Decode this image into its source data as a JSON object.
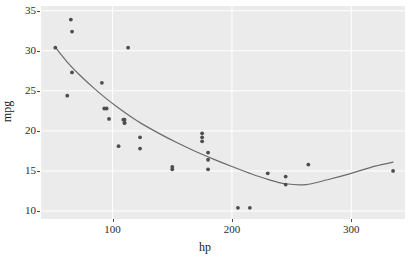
{
  "chart_data": {
    "type": "scatter",
    "title": "",
    "xlabel": "hp",
    "ylabel": "mpg",
    "xlim": [
      40,
      345
    ],
    "ylim": [
      9.0,
      35.6
    ],
    "xticks": [
      100,
      200,
      300
    ],
    "xticklabels": [
      "100",
      "200",
      "300"
    ],
    "yticks": [
      10,
      15,
      20,
      25,
      30,
      35
    ],
    "yticklabels": [
      "10",
      "15",
      "20",
      "25",
      "30",
      "35"
    ],
    "grid": true,
    "grid_major_color": "#ffffff",
    "panel_background": "#ebebeb",
    "point_color": "#4d4d4d",
    "line_color": "#6b6b6b",
    "legend": "none",
    "series": [
      {
        "name": "observations",
        "type": "scatter",
        "x": [
          110,
          110,
          93,
          110,
          175,
          105,
          245,
          62,
          95,
          123,
          123,
          180,
          180,
          180,
          205,
          215,
          230,
          66,
          52,
          65,
          97,
          150,
          150,
          245,
          175,
          66,
          91,
          113,
          264,
          175,
          335,
          109
        ],
        "y": [
          21.0,
          21.0,
          22.8,
          21.4,
          18.7,
          18.1,
          14.3,
          24.4,
          22.8,
          19.2,
          17.8,
          16.4,
          17.3,
          15.2,
          10.4,
          10.4,
          14.7,
          32.4,
          30.4,
          33.9,
          21.5,
          15.5,
          15.2,
          13.3,
          19.2,
          27.3,
          26.0,
          30.4,
          15.8,
          19.7,
          15.0,
          21.4
        ]
      },
      {
        "name": "smooth-fit",
        "type": "line",
        "x": [
          52,
          62,
          72,
          85,
          95,
          105,
          115,
          125,
          140,
          155,
          170,
          185,
          200,
          215,
          230,
          245,
          262,
          280,
          300,
          320,
          335
        ],
        "y": [
          30.45,
          28.6,
          27.05,
          25.25,
          24.0,
          22.85,
          21.8,
          20.85,
          19.6,
          18.45,
          17.4,
          16.45,
          15.55,
          14.7,
          13.95,
          13.4,
          13.3,
          13.9,
          14.7,
          15.6,
          16.1
        ]
      }
    ]
  },
  "axes": {
    "x_title": "hp",
    "y_title": "mpg"
  }
}
